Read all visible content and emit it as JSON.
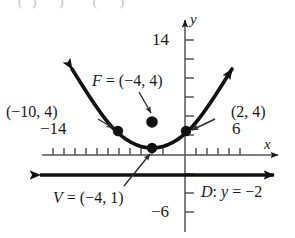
{
  "figure": {
    "kind": "parabola-graph",
    "background": "#ffffff",
    "ink": "#1a1a1a"
  },
  "axes": {
    "x_axis_label": "x",
    "y_axis_label": "y",
    "x_tick_label_left": "−14",
    "x_tick_label_right": "6",
    "y_tick_label_top": "14",
    "y_tick_label_bottom": "−6"
  },
  "annotations": {
    "focus": "F = (−4, 4)",
    "vertex": "V = (−4, 1)",
    "point_left": "(−10, 4)",
    "point_right": "(2, 4)",
    "directrix": "D: y = −2"
  },
  "chart_data": {
    "type": "line",
    "title": "",
    "xlabel": "x",
    "ylabel": "y",
    "xlim": [
      -16,
      8
    ],
    "ylim": [
      -7,
      15
    ],
    "grid": false,
    "legend": "none",
    "curve": {
      "name": "parabola",
      "equation_vertex_form": "y = (1/12)(x + 4)^2 + 1",
      "vertex": [
        -4,
        1
      ],
      "focus": [
        -4,
        4
      ],
      "directrix_y": -2,
      "points_marked": [
        [
          -10,
          4
        ],
        [
          -4,
          1
        ],
        [
          2,
          4
        ]
      ]
    },
    "marked_points": [
      {
        "label": "(−10, 4)",
        "x": -10,
        "y": 4
      },
      {
        "label": "V = (−4, 1)",
        "x": -4,
        "y": 1
      },
      {
        "label": "(2, 4)",
        "x": 2,
        "y": 4
      },
      {
        "label": "F = (−4, 4)",
        "x": -4,
        "y": 4
      }
    ],
    "lines": [
      {
        "label": "D: y = −2",
        "type": "horizontal",
        "y": -2
      }
    ],
    "x_ticks": [
      -14,
      -13,
      -12,
      -11,
      -10,
      -9,
      -8,
      -7,
      -6,
      -5,
      -4,
      -3,
      -2,
      -1,
      1,
      2,
      3,
      4,
      5,
      6
    ],
    "y_ticks": [
      -6,
      -4,
      -2,
      2,
      4,
      6,
      8,
      10,
      12,
      14
    ],
    "x_ticks_labeled": [
      -14,
      6
    ],
    "y_ticks_labeled": [
      14,
      -6
    ]
  }
}
